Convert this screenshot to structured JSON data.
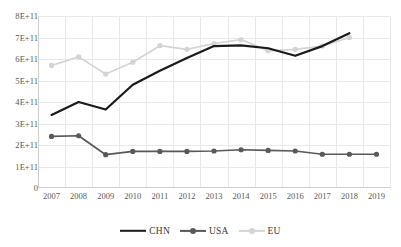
{
  "chart_data": {
    "type": "line",
    "title": "",
    "xlabel": "",
    "ylabel": "",
    "categories": [
      "2007",
      "2008",
      "2009",
      "2010",
      "2011",
      "2012",
      "2013",
      "2014",
      "2015",
      "2016",
      "2017",
      "2018",
      "2019"
    ],
    "ylim": [
      0,
      800000000000
    ],
    "ytick_labels": [
      "8E+11",
      "7E+11",
      "6E+11",
      "5E+11",
      "4E+11",
      "3E+11",
      "2E+11",
      "1E+11",
      "0"
    ],
    "ytick_values": [
      800000000000,
      700000000000,
      600000000000,
      500000000000,
      400000000000,
      300000000000,
      200000000000,
      100000000000,
      0
    ],
    "grid": true,
    "legend_position": "bottom",
    "series": [
      {
        "name": "CHN",
        "color": "#1a1a1a",
        "marker": "none",
        "x": [
          "2007",
          "2008",
          "2009",
          "2010",
          "2011",
          "2012",
          "2013",
          "2014",
          "2015",
          "2016",
          "2017",
          "2018"
        ],
        "values": [
          340000000000,
          400000000000,
          365000000000,
          480000000000,
          545000000000,
          605000000000,
          660000000000,
          663000000000,
          650000000000,
          615000000000,
          660000000000,
          720000000000
        ]
      },
      {
        "name": "USA",
        "color": "#595959",
        "marker": "circle",
        "x": [
          "2007",
          "2008",
          "2009",
          "2010",
          "2011",
          "2012",
          "2013",
          "2014",
          "2015",
          "2016",
          "2017",
          "2018",
          "2019"
        ],
        "values": [
          240000000000,
          243000000000,
          155000000000,
          170000000000,
          170000000000,
          170000000000,
          172000000000,
          178000000000,
          175000000000,
          172000000000,
          157000000000,
          157000000000,
          157000000000
        ]
      },
      {
        "name": "EU",
        "color": "#d4d4d4",
        "marker": "circle",
        "x": [
          "2007",
          "2008",
          "2009",
          "2010",
          "2011",
          "2012",
          "2013",
          "2014",
          "2015",
          "2016",
          "2017",
          "2018"
        ],
        "values": [
          570000000000,
          610000000000,
          530000000000,
          585000000000,
          662000000000,
          645000000000,
          672000000000,
          690000000000,
          638000000000,
          645000000000,
          660000000000,
          700000000000
        ]
      }
    ]
  },
  "legend": {
    "items": [
      {
        "label": "CHN"
      },
      {
        "label": "USA"
      },
      {
        "label": "EU"
      }
    ]
  }
}
